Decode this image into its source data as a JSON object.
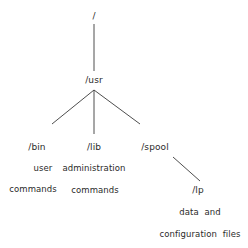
{
  "diagram": {
    "type": "directory-tree",
    "nodes": {
      "root": {
        "label": "/"
      },
      "usr": {
        "label": "/usr"
      },
      "bin": {
        "label": "/bin",
        "desc_line1": "user",
        "desc_line2": "commands"
      },
      "lib": {
        "label": "/lib",
        "desc_line1": "administration",
        "desc_line2": "commands"
      },
      "spool": {
        "label": "/spool"
      },
      "lp": {
        "label": "/lp",
        "desc_line1": "data  and",
        "desc_line2": "configuration  files"
      }
    },
    "edges": [
      {
        "from": "root",
        "to": "usr"
      },
      {
        "from": "usr",
        "to": "bin"
      },
      {
        "from": "usr",
        "to": "lib"
      },
      {
        "from": "usr",
        "to": "spool"
      },
      {
        "from": "spool",
        "to": "lp"
      }
    ],
    "colors": {
      "line": "#3a3a3a",
      "text": "#2a2a2a",
      "background": "#ffffff"
    }
  }
}
